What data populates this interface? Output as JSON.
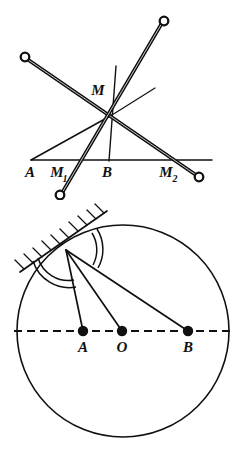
{
  "figure": {
    "kind": "geometry-diagram",
    "panels": [
      {
        "id": "linkage-panel",
        "name": "crossed-rods-linkage",
        "labels": {
          "intersection": "M",
          "base_left": "A",
          "base_mid_left": "M",
          "base_mid_left_sub": "1",
          "base_mid": "B",
          "base_right": "M",
          "base_right_sub": "2"
        },
        "elements": {
          "rod_count": 2,
          "pin_joint_count": 4,
          "baseline_label": "A B"
        }
      },
      {
        "id": "circle-panel",
        "name": "circle-with-tangent-and-rays",
        "labels": {
          "point_a": "A",
          "point_o": "O",
          "point_b": "B"
        },
        "elements": {
          "circle": "circle",
          "tangent": "hatched-tangent-line",
          "diameter": "dashed-diameter",
          "rays": 3,
          "angle_arcs": 2,
          "marked_points": 3
        }
      }
    ],
    "colors": {
      "ink": "#101010",
      "paper": "#ffffff"
    }
  }
}
